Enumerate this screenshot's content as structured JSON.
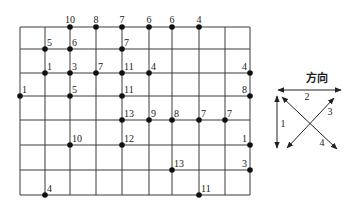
{
  "diagram": {
    "grid": {
      "columns": 9,
      "rows": 7
    },
    "points": [
      {
        "col": 2,
        "row": 0,
        "value": "10"
      },
      {
        "col": 3,
        "row": 0,
        "value": "8"
      },
      {
        "col": 4,
        "row": 0,
        "value": "7"
      },
      {
        "col": 5,
        "row": 0,
        "value": "6"
      },
      {
        "col": 6,
        "row": 0,
        "value": "6"
      },
      {
        "col": 7,
        "row": 0,
        "value": "4"
      },
      {
        "col": 1,
        "row": 1,
        "value": "5"
      },
      {
        "col": 2,
        "row": 1,
        "value": "6"
      },
      {
        "col": 4,
        "row": 1,
        "value": "7"
      },
      {
        "col": 1,
        "row": 2,
        "value": "1"
      },
      {
        "col": 2,
        "row": 2,
        "value": "3"
      },
      {
        "col": 3,
        "row": 2,
        "value": "7"
      },
      {
        "col": 4,
        "row": 2,
        "value": "11"
      },
      {
        "col": 5,
        "row": 2,
        "value": "4"
      },
      {
        "col": 9,
        "row": 2,
        "value": "4",
        "label_side": "left"
      },
      {
        "col": 0,
        "row": 3,
        "value": "1"
      },
      {
        "col": 2,
        "row": 3,
        "value": "5"
      },
      {
        "col": 4,
        "row": 3,
        "value": "11"
      },
      {
        "col": 9,
        "row": 3,
        "value": "8",
        "label_side": "left"
      },
      {
        "col": 4,
        "row": 4,
        "value": "13"
      },
      {
        "col": 5,
        "row": 4,
        "value": "9"
      },
      {
        "col": 6,
        "row": 4,
        "value": "8"
      },
      {
        "col": 7,
        "row": 4,
        "value": "7"
      },
      {
        "col": 8,
        "row": 4,
        "value": "7"
      },
      {
        "col": 2,
        "row": 5,
        "value": "10"
      },
      {
        "col": 4,
        "row": 5,
        "value": "12"
      },
      {
        "col": 9,
        "row": 5,
        "value": "1",
        "label_side": "left"
      },
      {
        "col": 6,
        "row": 6,
        "value": "13"
      },
      {
        "col": 9,
        "row": 6,
        "value": "3",
        "label_side": "left"
      },
      {
        "col": 1,
        "row": 7,
        "value": "4"
      },
      {
        "col": 7,
        "row": 7,
        "value": "11"
      }
    ]
  },
  "legend": {
    "title": "方向",
    "directions": [
      {
        "id": "1",
        "label": "1",
        "description": "vertical"
      },
      {
        "id": "2",
        "label": "2",
        "description": "horizontal"
      },
      {
        "id": "3",
        "label": "3",
        "description": "diagonal bottom-left to top-right"
      },
      {
        "id": "4",
        "label": "4",
        "description": "diagonal top-left to bottom-right"
      }
    ]
  }
}
